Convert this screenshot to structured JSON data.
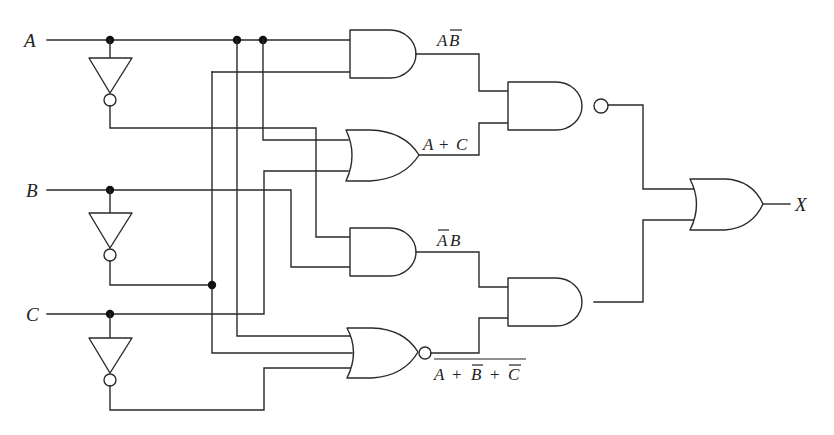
{
  "diagram": {
    "type": "combinational-logic-circuit",
    "inputs": [
      {
        "id": "A",
        "label": "A"
      },
      {
        "id": "B",
        "label": "B"
      },
      {
        "id": "C",
        "label": "C"
      }
    ],
    "output": {
      "id": "X",
      "label": "X"
    },
    "gates": [
      {
        "id": "inv_a",
        "type": "NOT",
        "inputs": [
          "A"
        ],
        "output": "A'"
      },
      {
        "id": "inv_b",
        "type": "NOT",
        "inputs": [
          "B"
        ],
        "output": "B'"
      },
      {
        "id": "inv_c",
        "type": "NOT",
        "inputs": [
          "C"
        ],
        "output": "C'"
      },
      {
        "id": "and1",
        "type": "AND",
        "inputs": [
          "A",
          "B'"
        ],
        "label": "AB̄"
      },
      {
        "id": "or1",
        "type": "OR",
        "inputs": [
          "A",
          "C"
        ],
        "label": "A + C"
      },
      {
        "id": "and2",
        "type": "AND",
        "inputs": [
          "A'",
          "B"
        ],
        "label": "ĀB"
      },
      {
        "id": "nor1",
        "type": "NOR",
        "inputs": [
          "A",
          "B'",
          "C'"
        ],
        "label": "NOT(A + B̄ + C̄)"
      },
      {
        "id": "nand1",
        "type": "NAND",
        "inputs": [
          "and1",
          "or1"
        ]
      },
      {
        "id": "and3",
        "type": "AND",
        "inputs": [
          "and2",
          "nor1"
        ]
      },
      {
        "id": "or_out",
        "type": "OR",
        "inputs": [
          "nand1",
          "and3"
        ],
        "output": "X"
      }
    ],
    "labels": {
      "input_a": "A",
      "input_b": "B",
      "input_c": "C",
      "output_x": "X",
      "and1_term_a": "A",
      "and1_term_b": "B",
      "or1_term": "A + C",
      "or1_term_a": "A",
      "or1_term_plus": "+",
      "or1_term_c": "C",
      "and2_term_a": "A",
      "and2_term_b": "B",
      "nor_term_a": "A",
      "nor_term_plus1": "+",
      "nor_term_b": "B",
      "nor_term_plus2": "+",
      "nor_term_c": "C"
    }
  }
}
